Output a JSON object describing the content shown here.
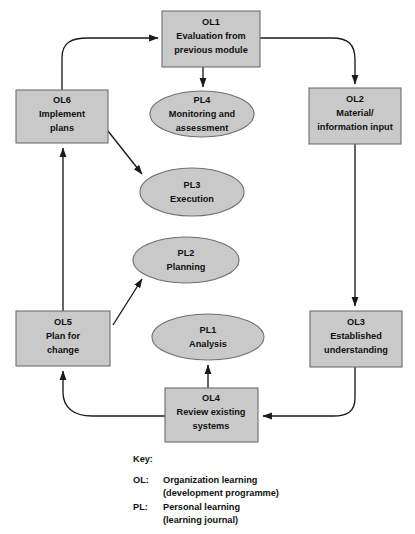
{
  "diagram": {
    "colors": {
      "node_fill": "#c9c9c9",
      "node_stroke": "#6e6e6e",
      "connector": "#1a1a1a",
      "text": "#111111",
      "background": "#ffffff"
    },
    "nodes": [
      {
        "id": "OL1",
        "shape": "rectangle",
        "code": "OL1",
        "line1": "Evaluation from",
        "line2": "previous module",
        "x": 162,
        "y": 11,
        "w": 98,
        "h": 56
      },
      {
        "id": "OL2",
        "shape": "rectangle",
        "code": "OL2",
        "line1": "Material/",
        "line2": "information input",
        "x": 309,
        "y": 88,
        "w": 92,
        "h": 56
      },
      {
        "id": "OL3",
        "shape": "rectangle",
        "code": "OL3",
        "line1": "Established",
        "line2": "understanding",
        "x": 310,
        "y": 311,
        "w": 92,
        "h": 56
      },
      {
        "id": "OL4",
        "shape": "rectangle",
        "code": "OL4",
        "line1": "Review existing",
        "line2": "systems",
        "x": 165,
        "y": 388,
        "w": 93,
        "h": 54
      },
      {
        "id": "OL5",
        "shape": "rectangle",
        "code": "OL5",
        "line1": "Plan for",
        "line2": "change",
        "x": 16,
        "y": 311,
        "w": 94,
        "h": 55
      },
      {
        "id": "OL6",
        "shape": "rectangle",
        "code": "OL6",
        "line1": "Implement",
        "line2": "plans",
        "x": 16,
        "y": 90,
        "w": 92,
        "h": 53
      },
      {
        "id": "PL4",
        "shape": "ellipse",
        "code": "PL4",
        "line1": "Monitoring and",
        "line2": "assessment",
        "cx": 202,
        "cy": 114,
        "rx": 52,
        "ry": 23
      },
      {
        "id": "PL3",
        "shape": "ellipse",
        "code": "PL3",
        "line1": "Execution",
        "line2": "",
        "cx": 192,
        "cy": 192,
        "rx": 52,
        "ry": 24
      },
      {
        "id": "PL2",
        "shape": "ellipse",
        "code": "PL2",
        "line1": "Planning",
        "line2": "",
        "cx": 186,
        "cy": 260,
        "rx": 53,
        "ry": 23
      },
      {
        "id": "PL1",
        "shape": "ellipse",
        "code": "PL1",
        "line1": "Analysis",
        "line2": "",
        "cx": 208,
        "cy": 337,
        "rx": 56,
        "ry": 23
      }
    ],
    "connectors": [
      {
        "id": "ol6-to-ol1",
        "from": "OL6",
        "to": "OL1",
        "style": "curved"
      },
      {
        "id": "ol1-to-ol2",
        "from": "OL1",
        "to": "OL2",
        "style": "curved"
      },
      {
        "id": "ol1-to-pl4",
        "from": "OL1",
        "to": "PL4",
        "style": "straight"
      },
      {
        "id": "ol2-to-ol3",
        "from": "OL2",
        "to": "OL3",
        "style": "straight"
      },
      {
        "id": "ol3-to-ol4",
        "from": "OL3",
        "to": "OL4",
        "style": "curved"
      },
      {
        "id": "ol4-to-pl1",
        "from": "OL4",
        "to": "PL1",
        "style": "straight"
      },
      {
        "id": "ol4-to-ol5",
        "from": "OL4",
        "to": "OL5",
        "style": "curved"
      },
      {
        "id": "ol5-to-ol6",
        "from": "OL5",
        "to": "OL6",
        "style": "straight"
      },
      {
        "id": "ol5-to-pl2",
        "from": "OL5",
        "to": "PL2",
        "style": "diagonal"
      },
      {
        "id": "ol6-to-pl3",
        "from": "OL6",
        "to": "PL3",
        "style": "diagonal"
      }
    ]
  },
  "key": {
    "heading": "Key:",
    "entries": [
      {
        "tag": "OL:",
        "line1": "Organization learning",
        "line2": "(development programme)"
      },
      {
        "tag": "PL:",
        "line1": "Personal learning",
        "line2": "(learning journal)"
      }
    ]
  }
}
